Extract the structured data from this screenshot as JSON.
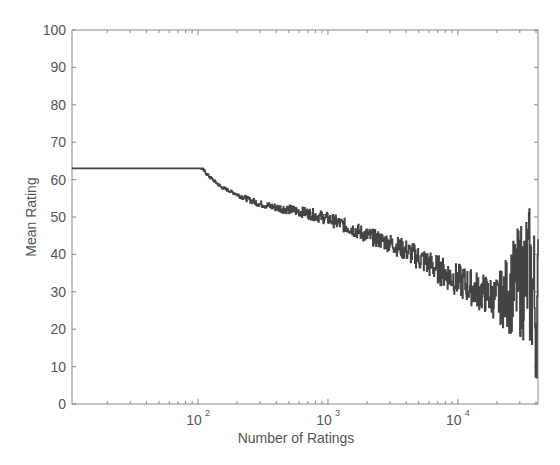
{
  "chart_data": {
    "type": "line",
    "title": "",
    "xlabel": "Number of Ratings",
    "ylabel": "Mean Rating",
    "xscale": "log",
    "xlim": [
      10.7,
      41400
    ],
    "ylim": [
      0,
      100
    ],
    "yticks": [
      0,
      10,
      20,
      30,
      40,
      50,
      60,
      70,
      80,
      90,
      100
    ],
    "xticks": [
      {
        "value": 100,
        "base": "10",
        "exp": "2"
      },
      {
        "value": 1000,
        "base": "10",
        "exp": "3"
      },
      {
        "value": 10000,
        "base": "10",
        "exp": "4"
      }
    ],
    "grid": false,
    "legend": null,
    "line_color": "#444444",
    "series": [
      {
        "name": "Mean Rating",
        "style": "noisy step line",
        "x": [
          11,
          15,
          20,
          25,
          30,
          40,
          50,
          60,
          70,
          80,
          90,
          100,
          120,
          150,
          200,
          250,
          300,
          400,
          500,
          700,
          1000,
          1500,
          2000,
          3000,
          4000,
          5000,
          7000,
          10000,
          13000,
          17000,
          20000,
          25000,
          30000,
          35000,
          40000
        ],
        "y": [
          83,
          82.5,
          82,
          81,
          80,
          78,
          76,
          73.5,
          71,
          68,
          65.5,
          64,
          61,
          58,
          56,
          54.5,
          53.5,
          52.5,
          52,
          51,
          49.5,
          47,
          45,
          43,
          41,
          39,
          36,
          33,
          31,
          29,
          28,
          30,
          33,
          35,
          25
        ],
        "noise_band_at_high_x": {
          "from": 20000,
          "ymin": 8,
          "ymax": 63
        }
      }
    ]
  }
}
